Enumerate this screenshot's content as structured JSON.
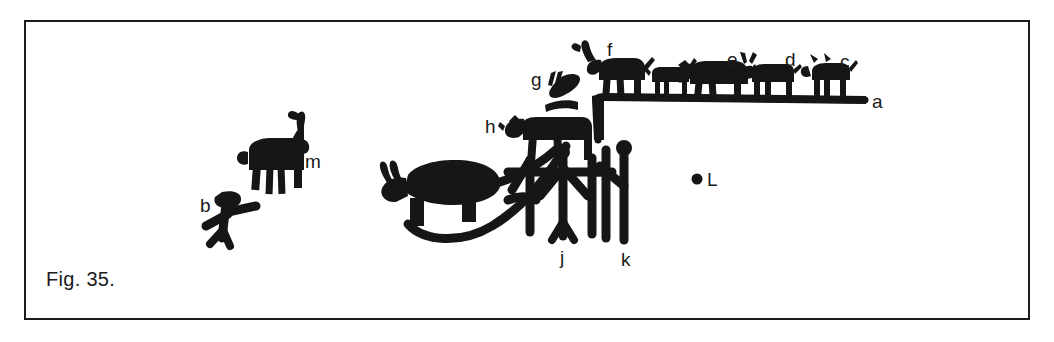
{
  "figure": {
    "caption": "Fig. 35.",
    "background_color": "#ffffff",
    "ink_color": "#161616",
    "frame_color": "#1c1c1c"
  },
  "labels": [
    {
      "id": "a",
      "text": "a",
      "x": 872,
      "y": 92,
      "describes": "horizontal ground line on which animals c, d, e stand"
    },
    {
      "id": "b",
      "text": "b",
      "x": 200,
      "y": 196,
      "describes": "small human figure with outstretched arms"
    },
    {
      "id": "c",
      "text": "c",
      "x": 840,
      "y": 52,
      "describes": "quadruped animal standing on ground line"
    },
    {
      "id": "d",
      "text": "d",
      "x": 785,
      "y": 50,
      "describes": "horned quadruped standing on ground line"
    },
    {
      "id": "e",
      "text": "e",
      "x": 727,
      "y": 50,
      "describes": "large quadruped with lowered head on ground line"
    },
    {
      "id": "f",
      "text": "f",
      "x": 607,
      "y": 40,
      "describes": "ibex with long curved horns on ground line"
    },
    {
      "id": "g",
      "text": "g",
      "x": 531,
      "y": 70,
      "describes": "cluster of small elongated marks"
    },
    {
      "id": "h",
      "text": "h",
      "x": 485,
      "y": 117,
      "describes": "quadruped above the human figures"
    },
    {
      "id": "i",
      "text": "i",
      "x": 419,
      "y": 163,
      "describes": "large animal with long curved tail"
    },
    {
      "id": "j",
      "text": "j",
      "x": 560,
      "y": 248,
      "describes": "human figure with raised arms"
    },
    {
      "id": "k",
      "text": "k",
      "x": 621,
      "y": 250,
      "describes": "human figure holding a staff"
    },
    {
      "id": "L",
      "text": "L",
      "x": 707,
      "y": 176,
      "describes": "isolated dot mark"
    },
    {
      "id": "m",
      "text": "m",
      "x": 305,
      "y": 158,
      "describes": "ibex with long backward horns"
    }
  ],
  "elements": {
    "ground_line": "stepped horizontal baseline from x=595 rising to the right edge near x=865",
    "dot_L": {
      "x": 697,
      "y": 179,
      "radius": 5
    },
    "unlabeled_animal": "small dog-like quadruped between f and e on the ground line"
  }
}
